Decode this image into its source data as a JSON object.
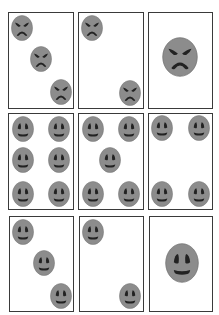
{
  "figure": {
    "width": 219,
    "height": 315,
    "colors": {
      "face_fill": "#8c8c8c",
      "face_outline": "#6f6f6f",
      "feature": "#222222",
      "card_border": "#3a3a3a",
      "card_fill": "#ffffff"
    },
    "cards": [
      {
        "id": "r1c1",
        "row": 1,
        "col": 1,
        "emotion": "angry",
        "count": 3,
        "box": {
          "x": 8,
          "y": 12,
          "w": 66,
          "h": 97
        },
        "faces": [
          {
            "cx": 22,
            "cy": 28,
            "w": 22,
            "h": 26
          },
          {
            "cx": 41,
            "cy": 59,
            "w": 22,
            "h": 26
          },
          {
            "cx": 61,
            "cy": 92,
            "w": 22,
            "h": 26
          }
        ]
      },
      {
        "id": "r1c2",
        "row": 1,
        "col": 2,
        "emotion": "angry",
        "count": 2,
        "box": {
          "x": 78,
          "y": 12,
          "w": 66,
          "h": 97
        },
        "faces": [
          {
            "cx": 92,
            "cy": 28,
            "w": 22,
            "h": 26
          },
          {
            "cx": 130,
            "cy": 93,
            "w": 22,
            "h": 26
          }
        ]
      },
      {
        "id": "r1c3",
        "row": 1,
        "col": 3,
        "emotion": "angry",
        "count": 1,
        "box": {
          "x": 148,
          "y": 12,
          "w": 65,
          "h": 97
        },
        "faces": [
          {
            "cx": 180,
            "cy": 57,
            "w": 36,
            "h": 40
          }
        ]
      },
      {
        "id": "r2c1",
        "row": 2,
        "col": 1,
        "emotion": "happy",
        "count": 6,
        "box": {
          "x": 8,
          "y": 113,
          "w": 66,
          "h": 97
        },
        "faces": [
          {
            "cx": 23,
            "cy": 129,
            "w": 22,
            "h": 26
          },
          {
            "cx": 59,
            "cy": 129,
            "w": 22,
            "h": 26
          },
          {
            "cx": 23,
            "cy": 160,
            "w": 22,
            "h": 26
          },
          {
            "cx": 59,
            "cy": 160,
            "w": 22,
            "h": 26
          },
          {
            "cx": 23,
            "cy": 194,
            "w": 22,
            "h": 26
          },
          {
            "cx": 59,
            "cy": 194,
            "w": 22,
            "h": 26
          }
        ]
      },
      {
        "id": "r2c2",
        "row": 2,
        "col": 2,
        "emotion": "happy",
        "count": 5,
        "box": {
          "x": 78,
          "y": 113,
          "w": 66,
          "h": 97
        },
        "faces": [
          {
            "cx": 93,
            "cy": 129,
            "w": 22,
            "h": 26
          },
          {
            "cx": 129,
            "cy": 129,
            "w": 22,
            "h": 26
          },
          {
            "cx": 110,
            "cy": 160,
            "w": 22,
            "h": 26
          },
          {
            "cx": 93,
            "cy": 194,
            "w": 22,
            "h": 26
          },
          {
            "cx": 129,
            "cy": 194,
            "w": 22,
            "h": 26
          }
        ]
      },
      {
        "id": "r2c3",
        "row": 2,
        "col": 3,
        "emotion": "happy",
        "count": 4,
        "box": {
          "x": 148,
          "y": 113,
          "w": 65,
          "h": 97
        },
        "faces": [
          {
            "cx": 162,
            "cy": 128,
            "w": 22,
            "h": 26
          },
          {
            "cx": 199,
            "cy": 128,
            "w": 22,
            "h": 26
          },
          {
            "cx": 162,
            "cy": 194,
            "w": 22,
            "h": 26
          },
          {
            "cx": 199,
            "cy": 194,
            "w": 22,
            "h": 26
          }
        ]
      },
      {
        "id": "r3c1",
        "row": 3,
        "col": 1,
        "emotion": "happy",
        "count": 3,
        "box": {
          "x": 9,
          "y": 216,
          "w": 65,
          "h": 96
        },
        "faces": [
          {
            "cx": 23,
            "cy": 232,
            "w": 22,
            "h": 26
          },
          {
            "cx": 44,
            "cy": 263,
            "w": 22,
            "h": 26
          },
          {
            "cx": 61,
            "cy": 296,
            "w": 22,
            "h": 26
          }
        ]
      },
      {
        "id": "r3c2",
        "row": 3,
        "col": 2,
        "emotion": "happy",
        "count": 2,
        "box": {
          "x": 79,
          "y": 216,
          "w": 65,
          "h": 96
        },
        "faces": [
          {
            "cx": 93,
            "cy": 232,
            "w": 22,
            "h": 26
          },
          {
            "cx": 130,
            "cy": 296,
            "w": 22,
            "h": 26
          }
        ]
      },
      {
        "id": "r3c3",
        "row": 3,
        "col": 3,
        "emotion": "happy",
        "count": 1,
        "box": {
          "x": 149,
          "y": 216,
          "w": 64,
          "h": 96
        },
        "faces": [
          {
            "cx": 182,
            "cy": 263,
            "w": 34,
            "h": 40
          }
        ]
      }
    ]
  }
}
